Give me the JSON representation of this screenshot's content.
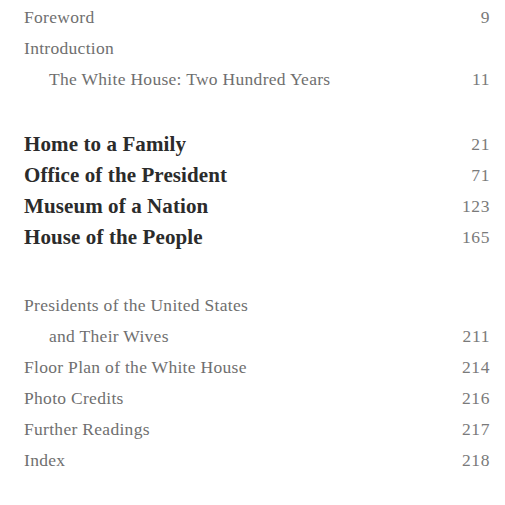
{
  "page": {
    "kind": "table-of-contents",
    "background_color": "#ffffff",
    "text_color_regular": "#6f6f6f",
    "text_color_bold": "#2b2b2b",
    "page_number_color": "#7a7a7a"
  },
  "toc": {
    "front_matter": [
      {
        "label": "Foreword",
        "page": "9",
        "indent": false
      },
      {
        "label": "Introduction",
        "page": "",
        "indent": false
      },
      {
        "label": "The White House: Two Hundred Years",
        "page": "11",
        "indent": true
      }
    ],
    "chapters": [
      {
        "label": "Home to a Family",
        "page": "21",
        "indent": false
      },
      {
        "label": "Office of the President",
        "page": "71",
        "indent": false
      },
      {
        "label": "Museum of a Nation",
        "page": "123",
        "indent": false
      },
      {
        "label": "House of the People",
        "page": "165",
        "indent": false
      }
    ],
    "back_matter": [
      {
        "label": "Presidents of the United States",
        "page": "",
        "indent": false
      },
      {
        "label": "and Their Wives",
        "page": "211",
        "indent": true
      },
      {
        "label": "Floor Plan of the White House",
        "page": "214",
        "indent": false
      },
      {
        "label": "Photo Credits",
        "page": "216",
        "indent": false
      },
      {
        "label": "Further Readings",
        "page": "217",
        "indent": false
      },
      {
        "label": "Index",
        "page": "218",
        "indent": false
      }
    ]
  }
}
